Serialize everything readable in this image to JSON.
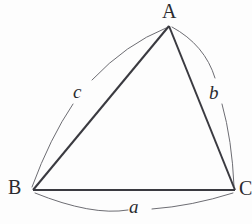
{
  "figure": {
    "kind": "geometry-diagram",
    "canvas": {
      "width": 252,
      "height": 224
    },
    "background_color": "#fdfdfd",
    "stroke_color": "#3a3a40",
    "arc_color": "#6d6d73",
    "text_color": "#2b2b2f",
    "side_stroke_width": 2,
    "arc_stroke_width": 1
  },
  "vertices": [
    {
      "name": "A",
      "label": "A",
      "x": 169,
      "y": 26,
      "label_x": 170,
      "label_y": 11,
      "clipped": false
    },
    {
      "name": "B",
      "label": "B",
      "x": 33,
      "y": 190,
      "label_x": 16,
      "label_y": 187,
      "clipped": false
    },
    {
      "name": "C",
      "label": "C",
      "x": 235,
      "y": 190,
      "label_x": 246,
      "label_y": 188,
      "clipped": true
    }
  ],
  "sides": [
    {
      "label": "a",
      "label_x": 136,
      "label_y": 207,
      "from": "B",
      "to": "C",
      "path": "M 33 190 L 235 190",
      "arc": {
        "bulge": "outward-down",
        "segment_1": "M 35 193 Q 92 216 128 210",
        "segment_2": "M 152 209 Q 192 206 233 193"
      }
    },
    {
      "label": "b",
      "label_x": 216,
      "label_y": 92,
      "from": "C",
      "to": "A",
      "path": "M 235 190 L 169 26",
      "arc": {
        "bulge": "outward-right",
        "segment_1": "M 172 27 Q 205 45 215 78",
        "segment_2": "M 222 104 Q 232 140 234 186"
      }
    },
    {
      "label": "c",
      "label_x": 80,
      "label_y": 91,
      "from": "A",
      "to": "B",
      "path": "M 169 26 L 33 190",
      "arc": {
        "bulge": "outward-left",
        "segment_1": "M 166 28 Q 126 44 92 80",
        "segment_2": "M 73 104 Q 50 138 32 187"
      }
    }
  ]
}
